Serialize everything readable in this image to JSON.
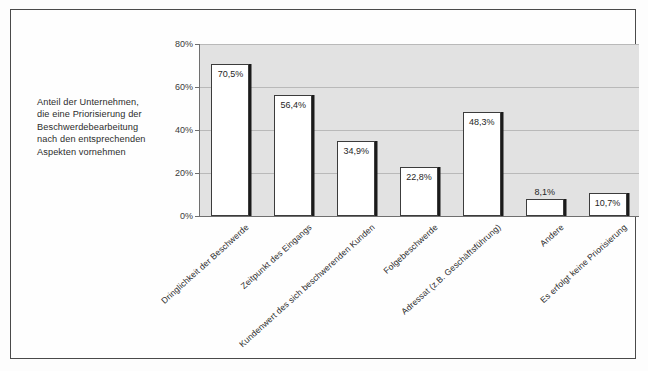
{
  "caption": {
    "lines": [
      "Anteil der Unternehmen,",
      "die eine Priorisierung der",
      "Beschwerdebearbeitung",
      "nach den entsprechenden",
      "Aspekten vornehmen"
    ]
  },
  "chart_data": {
    "type": "bar",
    "title": "",
    "xlabel": "",
    "ylabel": "",
    "ylim": [
      0,
      80
    ],
    "yticks": [
      "0%",
      "20%",
      "40%",
      "60%",
      "80%"
    ],
    "ytick_values": [
      0,
      20,
      40,
      60,
      80
    ],
    "grid": true,
    "legend": false,
    "categories": [
      "Dringlichkeit der Beschwerde",
      "Zeitpunkt des Eingangs",
      "Kundenwert des sich beschwerenden Kunden",
      "Folgebeschwerde",
      "Adressat (z.B. Geschäftsführung)",
      "Andere",
      "Es erfolgt keine Priorisierung"
    ],
    "values": [
      70.5,
      56.4,
      34.9,
      22.8,
      48.3,
      8.1,
      10.7
    ],
    "data_labels": [
      "70,5%",
      "56,4%",
      "34,9%",
      "22,8%",
      "48,3%",
      "8,1%",
      "10,7%"
    ],
    "label_position": [
      "inside",
      "inside",
      "inside",
      "inside",
      "inside",
      "above",
      "inside"
    ],
    "bar_fill": "#ffffff",
    "bar_border": "#3c3c3c",
    "bar_shadow": "#1b1b1b",
    "plot_background": "#e2e2e2",
    "gridline_color": "#b9b9b9"
  }
}
